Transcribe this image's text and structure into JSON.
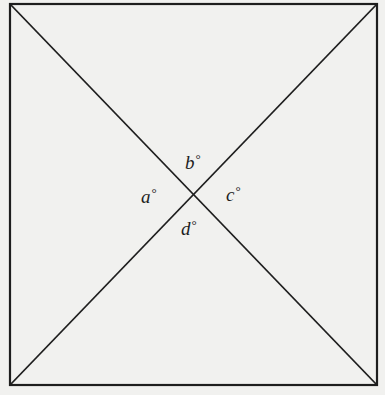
{
  "figure": {
    "type": "square-with-diagonals",
    "stroke_color": "#1e1e1e",
    "background_color": "#f1f1ef",
    "square": {
      "top_left": [
        10,
        4
      ],
      "top_right": [
        377,
        4
      ],
      "bottom_right": [
        377,
        385
      ],
      "bottom_left": [
        10,
        385
      ]
    },
    "intersection": [
      190,
      195
    ]
  },
  "labels": {
    "a": {
      "letter": "a",
      "degree": "°"
    },
    "b": {
      "letter": "b",
      "degree": "°"
    },
    "c": {
      "letter": "c",
      "degree": "°"
    },
    "d": {
      "letter": "d",
      "degree": "°"
    }
  }
}
